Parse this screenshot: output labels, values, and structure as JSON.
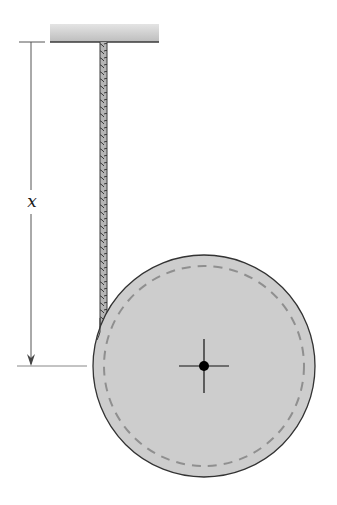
{
  "figure": {
    "type": "mechanics diagram",
    "dimension": {
      "label": "x",
      "meaning": "vertical distance from ceiling to disk center"
    },
    "elements": {
      "ceiling": "fixed support",
      "cord": "twisted rope",
      "disk": "uniform disk with dashed inner circle",
      "center": "center of mass marker"
    },
    "colors": {
      "ceiling_fill": "#c8c8c8",
      "disk_fill": "#cdcdcd",
      "disk_edge": "#333333",
      "dashed_circle": "#8f8f8f",
      "rope": "#9a9a9a",
      "dimension_line": "#555555",
      "center_mark": "#000000"
    }
  }
}
